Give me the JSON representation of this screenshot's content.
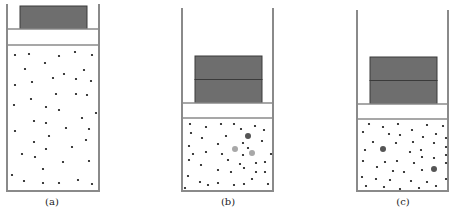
{
  "diagram": {
    "type": "piston-cylinder gas diagrams",
    "colors": {
      "wall": "#8a8a8a",
      "weight": "#6e6e6e",
      "weight_border": "#3a3a3a",
      "particle": "#111111",
      "particle_dark": "#555555",
      "particle_light": "#a8a8a8"
    },
    "panels": [
      {
        "id": "a",
        "label": "(a)",
        "label_x": 52,
        "cylinder": {
          "left": 7,
          "right": 99,
          "top": 4,
          "bottom": 191
        },
        "piston": {
          "top": 29,
          "bottom": 45
        },
        "weight": {
          "left": 20,
          "right": 87,
          "top": 6,
          "bottom": 29,
          "blocks": 1
        },
        "particles": [
          [
            15,
            55
          ],
          [
            29,
            54
          ],
          [
            59,
            56
          ],
          [
            75,
            52
          ],
          [
            92,
            55
          ],
          [
            25,
            69
          ],
          [
            45,
            63
          ],
          [
            84,
            70
          ],
          [
            53,
            78
          ],
          [
            64,
            74
          ],
          [
            76,
            79
          ],
          [
            91,
            81
          ],
          [
            15,
            85
          ],
          [
            32,
            82
          ],
          [
            56,
            94
          ],
          [
            76,
            94
          ],
          [
            87,
            95
          ],
          [
            14,
            105
          ],
          [
            31,
            99
          ],
          [
            46,
            107
          ],
          [
            59,
            110
          ],
          [
            96,
            113
          ],
          [
            34,
            121
          ],
          [
            82,
            118
          ],
          [
            46,
            123
          ],
          [
            15,
            131
          ],
          [
            66,
            128
          ],
          [
            89,
            129
          ],
          [
            49,
            136
          ],
          [
            34,
            142
          ],
          [
            86,
            140
          ],
          [
            72,
            147
          ],
          [
            46,
            149
          ],
          [
            22,
            154
          ],
          [
            35,
            157
          ],
          [
            89,
            161
          ],
          [
            63,
            162
          ],
          [
            43,
            169
          ],
          [
            12,
            175
          ],
          [
            24,
            181
          ],
          [
            43,
            183
          ],
          [
            59,
            183
          ],
          [
            78,
            180
          ],
          [
            92,
            184
          ]
        ],
        "highlight_particles": []
      },
      {
        "id": "b",
        "label": "(b)",
        "label_x": 228,
        "cylinder": {
          "left": 182,
          "right": 273,
          "top": 8,
          "bottom": 191
        },
        "piston": {
          "top": 103,
          "bottom": 118
        },
        "weight": {
          "left": 195,
          "right": 262,
          "top": 56,
          "bottom": 103,
          "blocks": 2
        },
        "particles": [
          [
            190,
            124
          ],
          [
            206,
            127
          ],
          [
            221,
            124
          ],
          [
            234,
            124
          ],
          [
            241,
            129
          ],
          [
            255,
            126
          ],
          [
            264,
            130
          ],
          [
            191,
            133
          ],
          [
            202,
            138
          ],
          [
            226,
            136
          ],
          [
            243,
            143
          ],
          [
            262,
            141
          ],
          [
            189,
            146
          ],
          [
            218,
            144
          ],
          [
            236,
            150
          ],
          [
            248,
            148
          ],
          [
            206,
            152
          ],
          [
            222,
            154
          ],
          [
            193,
            154
          ],
          [
            243,
            155
          ],
          [
            271,
            154
          ],
          [
            189,
            160
          ],
          [
            201,
            165
          ],
          [
            228,
            160
          ],
          [
            240,
            164
          ],
          [
            256,
            163
          ],
          [
            265,
            162
          ],
          [
            218,
            170
          ],
          [
            231,
            172
          ],
          [
            244,
            168
          ],
          [
            256,
            172
          ],
          [
            265,
            172
          ],
          [
            188,
            176
          ],
          [
            200,
            182
          ],
          [
            208,
            185
          ],
          [
            218,
            183
          ],
          [
            234,
            185
          ],
          [
            244,
            184
          ],
          [
            252,
            179
          ],
          [
            268,
            184
          ],
          [
            185,
            188
          ]
        ],
        "highlight_particles": [
          {
            "x": 248,
            "y": 136,
            "r": 3,
            "tone": "dark"
          },
          {
            "x": 235,
            "y": 149,
            "r": 3,
            "tone": "light"
          },
          {
            "x": 252,
            "y": 153,
            "r": 3,
            "tone": "light"
          }
        ]
      },
      {
        "id": "c",
        "label": "(c)",
        "label_x": 403,
        "cylinder": {
          "left": 357,
          "right": 448,
          "top": 10,
          "bottom": 191
        },
        "piston": {
          "top": 104,
          "bottom": 119
        },
        "weight": {
          "left": 370,
          "right": 437,
          "top": 57,
          "bottom": 104,
          "blocks": 2
        },
        "particles": [
          [
            369,
            124
          ],
          [
            383,
            127
          ],
          [
            398,
            124
          ],
          [
            412,
            130
          ],
          [
            427,
            125
          ],
          [
            443,
            126
          ],
          [
            363,
            132
          ],
          [
            389,
            134
          ],
          [
            400,
            135
          ],
          [
            423,
            137
          ],
          [
            436,
            134
          ],
          [
            446,
            138
          ],
          [
            373,
            142
          ],
          [
            396,
            143
          ],
          [
            413,
            142
          ],
          [
            434,
            143
          ],
          [
            446,
            147
          ],
          [
            365,
            150
          ],
          [
            410,
            152
          ],
          [
            421,
            150
          ],
          [
            446,
            155
          ],
          [
            363,
            161
          ],
          [
            385,
            162
          ],
          [
            397,
            161
          ],
          [
            414,
            163
          ],
          [
            422,
            157
          ],
          [
            434,
            158
          ],
          [
            446,
            163
          ],
          [
            377,
            167
          ],
          [
            393,
            171
          ],
          [
            404,
            172
          ],
          [
            422,
            170
          ],
          [
            362,
            177
          ],
          [
            376,
            179
          ],
          [
            390,
            180
          ],
          [
            411,
            181
          ],
          [
            427,
            182
          ],
          [
            446,
            179
          ],
          [
            366,
            186
          ],
          [
            384,
            187
          ],
          [
            400,
            189
          ],
          [
            419,
            188
          ],
          [
            436,
            186
          ]
        ],
        "highlight_particles": [
          {
            "x": 383,
            "y": 149,
            "r": 3,
            "tone": "dark"
          },
          {
            "x": 434,
            "y": 169,
            "r": 3,
            "tone": "dark"
          }
        ]
      }
    ]
  }
}
